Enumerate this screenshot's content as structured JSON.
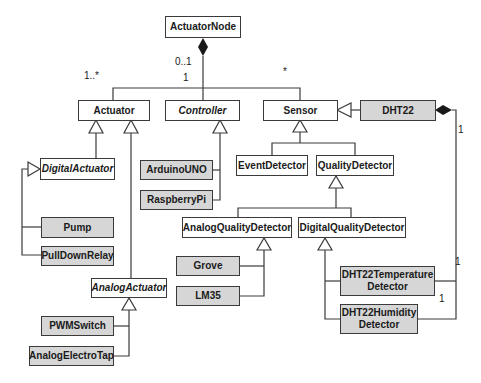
{
  "diagram": {
    "type": "UML class diagram",
    "colors": {
      "abstract_fill": "#ffffff",
      "concrete_fill": "#d6d6d6",
      "stroke": "#3a3a3a"
    },
    "classes": {
      "actuator_node": "ActuatorNode",
      "actuator": "Actuator",
      "controller": "Controller",
      "sensor": "Sensor",
      "dht22": "DHT22",
      "digital_actuator": "DigitalActuator",
      "arduino_uno": "ArduinoUNO",
      "raspberry_pi": "RaspberryPi",
      "event_detector": "EventDetector",
      "quality_detector": "QualityDetector",
      "analog_quality_detector": "AnalogQualityDetector",
      "digital_quality_detector": "DigitalQualityDetector",
      "pump": "Pump",
      "pull_down_relay": "PullDownRelay",
      "analog_actuator": "AnalogActuator",
      "grove": "Grove",
      "lm35": "LM35",
      "pwm_switch": "PWMSwitch",
      "analog_electro_tap": "AnalogElectroTap",
      "dht22_temperature_detector": "DHT22Temperature Detector",
      "dht22_humidity_detector": "DHT22Humidity Detector"
    },
    "multiplicities": {
      "node_controller_top": "0..1",
      "node_controller_bottom": "1",
      "node_actuator": "1..*",
      "node_sensor": "*",
      "dht22_side": "1",
      "temperature_end": "1",
      "humidity_end": "1"
    },
    "compositions": [
      {
        "whole": "ActuatorNode",
        "parts": [
          "Actuator",
          "Controller",
          "Sensor"
        ]
      },
      {
        "whole": "DHT22",
        "parts": [
          "DHT22Temperature Detector",
          "DHT22Humidity Detector"
        ]
      }
    ],
    "generalizations": [
      {
        "parent": "Actuator",
        "children": [
          "DigitalActuator",
          "AnalogActuator"
        ]
      },
      {
        "parent": "DigitalActuator",
        "children": [
          "Pump",
          "PullDownRelay"
        ]
      },
      {
        "parent": "AnalogActuator",
        "children": [
          "PWMSwitch",
          "AnalogElectroTap"
        ]
      },
      {
        "parent": "Controller",
        "children": [
          "ArduinoUNO",
          "RaspberryPi"
        ]
      },
      {
        "parent": "Sensor",
        "children": [
          "EventDetector",
          "QualityDetector",
          "DHT22"
        ]
      },
      {
        "parent": "QualityDetector",
        "children": [
          "AnalogQualityDetector",
          "DigitalQualityDetector"
        ]
      },
      {
        "parent": "AnalogQualityDetector",
        "children": [
          "Grove",
          "LM35"
        ]
      },
      {
        "parent": "DigitalQualityDetector",
        "children": [
          "DHT22Temperature Detector",
          "DHT22Humidity Detector"
        ]
      }
    ]
  }
}
